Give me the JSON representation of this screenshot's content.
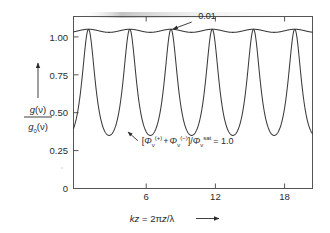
{
  "figure": {
    "background_color": "#ffffff",
    "line_color": "#3a3a3a",
    "axis_color": "#555555",
    "text_color": "#2b2b2b",
    "smudge_color": "#cfcfcf"
  },
  "chart_data": {
    "type": "line",
    "title": "",
    "subtitle": "",
    "xlabel": "kz = 2πz/λ",
    "xlabel_parts": {
      "k": "k",
      "z": "z",
      "equals": " = 2",
      "pi": "π",
      "z2": "z",
      "slash": "/",
      "lambda": "λ",
      "arrow": "⟶"
    },
    "ylabel": "g(ν)/g₀(ν)",
    "ylabel_parts": {
      "numerator_g": "g",
      "numerator_arg": "(ν)",
      "denominator_g": "g",
      "denominator_sub": "0",
      "denominator_arg": "(ν)",
      "arrow": "↑"
    },
    "xlim": [
      2.0,
      20.2
    ],
    "ylim": [
      0,
      1.08
    ],
    "xticks": [
      6,
      12,
      18
    ],
    "xticklabels": [
      "6",
      "12",
      "18"
    ],
    "yticks": [
      0,
      0.25,
      0.5,
      0.75,
      1.0
    ],
    "yticklabels": [
      "0",
      "0.25",
      "0.50",
      "0.75",
      "1.00"
    ],
    "grid": false,
    "legend_position": "none",
    "frame": "box",
    "period": 3.14159,
    "series": [
      {
        "name": "saturation-ratio-1.0",
        "label": "[Φν(+) + Φν(−)] / Φν sat = 1.0",
        "peak_value": 1.0,
        "min_value": 0.333,
        "peak_positions": [
          3.1416,
          6.2832,
          9.4248,
          12.5664,
          15.708,
          18.8496
        ],
        "min_positions": [
          4.712,
          7.854,
          10.996,
          14.137,
          17.279,
          20.42
        ],
        "formula_shape": "1/(1+2*cos^2(kz))"
      },
      {
        "name": "saturation-ratio-0.01",
        "label": "0.01",
        "peak_value": 1.0,
        "min_value": 0.9901,
        "peak_positions": [
          3.1416,
          6.2832,
          9.4248,
          12.5664,
          15.708,
          18.8496
        ],
        "min_positions": [
          4.712,
          7.854,
          10.996,
          14.137,
          17.279,
          20.42
        ],
        "formula_shape": "1/(1+0.02*cos^2(kz))"
      }
    ],
    "annotations": [
      {
        "name": "weak-saturation-label",
        "text": "0.01",
        "target_series": "saturation-ratio-0.01",
        "text_x": 11.5,
        "text_y": 1.065,
        "arrow_from": [
          11.0,
          1.045
        ],
        "arrow_to": [
          9.6,
          1.002
        ]
      },
      {
        "name": "strong-saturation-label",
        "text_x": 7.2,
        "text_y": 0.28,
        "arrow_from": [
          6.9,
          0.3
        ],
        "arrow_to": [
          6.15,
          0.355
        ],
        "formula": {
          "bracket_open": "[",
          "phi1": "Φ",
          "phi1_sub": "ν",
          "phi1_sup": "(+)",
          "plus": "+",
          "phi2": "Φ",
          "phi2_sub": "ν",
          "phi2_sup": "(−)",
          "bracket_close": "]",
          "slash": "/",
          "phi3": "Φ",
          "phi3_sub": "ν",
          "phi3_sup": "sat",
          "equals": "= 1.0"
        }
      }
    ]
  }
}
